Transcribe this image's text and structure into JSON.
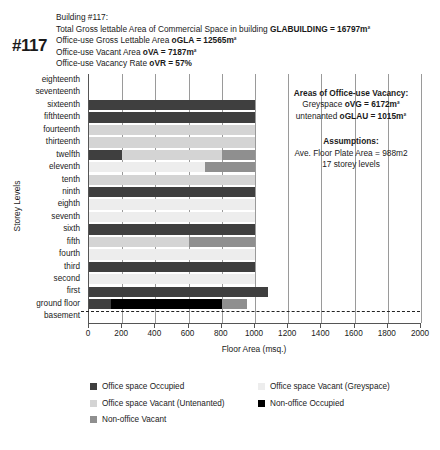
{
  "header": {
    "building_tag": "#117",
    "lines": [
      "Building #117:",
      "Total Gross lettable Area of Commercial Space in building GLABUILDING = 16797m²",
      "Office-use Gross Lettable Area oGLA = 12565m²",
      "Office-use Vacant Area oVA = 7187m²",
      "Office-use Vacancy Rate oVR = 57%"
    ],
    "line1": "Building #117:",
    "line2_pre": "Total Gross lettable Area of Commercial Space in building ",
    "line2_bold": "GLABUILDING = 16797m²",
    "line3_pre": "Office-use Gross Lettable Area ",
    "line3_bold": "oGLA = 12565m²",
    "line4_pre": "Office-use Vacant Area ",
    "line4_bold": "oVA = 7187m²",
    "line5_pre": "Office-use Vacancy Rate ",
    "line5_bold": "oVR = 57%"
  },
  "annotations": {
    "vacancy_title": "Areas of Office-use Vacancy:",
    "vacancy_line1_pre": "Greyspace ",
    "vacancy_line1_bold": "oVG = 6172m²",
    "vacancy_line2_pre": "untenanted ",
    "vacancy_line2_bold": "oGLAU = 1015m²",
    "assumptions_title": "Assumptions:",
    "assumptions_line1": "Ave. Floor Plate Area = 988m2",
    "assumptions_line2": "17 storey levels"
  },
  "colors": {
    "office_occupied": "#3f3f3f",
    "office_vacant_greyspace": "#ededed",
    "office_vacant_untenanted": "#d4d4d4",
    "non_office_occupied": "#000000",
    "non_office_vacant": "#8f8f8f",
    "axis": "#555555",
    "grid": "#9a9a9a"
  },
  "legend": {
    "items": [
      {
        "label": "Office space Occupied",
        "key": "office_occupied",
        "color": "#3f3f3f"
      },
      {
        "label": "Office space Vacant (Greyspace)",
        "key": "office_vacant_greyspace",
        "color": "#ededed"
      },
      {
        "label": "Office space Vacant (Untenanted)",
        "key": "office_vacant_untenanted",
        "color": "#d4d4d4"
      },
      {
        "label": "Non-office Occupied",
        "key": "non_office_occupied",
        "color": "#000000"
      },
      {
        "label": "Non-office Vacant",
        "key": "non_office_vacant",
        "color": "#8f8f8f"
      }
    ]
  },
  "chart_data": {
    "type": "bar",
    "orientation": "horizontal",
    "stacked": true,
    "title": "",
    "xlabel": "Floor Area (msq.)",
    "ylabel": "Storey Levels",
    "xlim": [
      0,
      2000
    ],
    "xticks": [
      0,
      200,
      400,
      600,
      800,
      1000,
      1200,
      1400,
      1600,
      1800,
      2000
    ],
    "grid": true,
    "legend_position": "bottom",
    "categories": [
      "eighteenth",
      "seventeenth",
      "sixteenth",
      "fifthteenth",
      "fourteenth",
      "thirteenth",
      "twelfth",
      "eleventh",
      "tenth",
      "ninth",
      "eighth",
      "seventh",
      "sixth",
      "fifth",
      "fourth",
      "third",
      "second",
      "first",
      "ground floor",
      "basement"
    ],
    "series": [
      {
        "name": "Office space Occupied",
        "key": "office_occupied",
        "values": [
          0,
          0,
          1000,
          1000,
          0,
          0,
          200,
          0,
          0,
          1000,
          0,
          0,
          1000,
          0,
          0,
          1000,
          0,
          1080,
          130,
          0
        ]
      },
      {
        "name": "Office space Vacant (Greyspace)",
        "key": "office_vacant_greyspace",
        "values": [
          0,
          0,
          0,
          0,
          0,
          0,
          0,
          700,
          0,
          0,
          1000,
          1000,
          0,
          0,
          1000,
          0,
          1000,
          0,
          0,
          0
        ]
      },
      {
        "name": "Office space Vacant (Untenanted)",
        "key": "office_vacant_untenanted",
        "values": [
          0,
          0,
          0,
          0,
          1000,
          1000,
          600,
          0,
          1000,
          0,
          0,
          0,
          0,
          600,
          0,
          0,
          0,
          0,
          0,
          0
        ]
      },
      {
        "name": "Non-office Occupied",
        "key": "non_office_occupied",
        "values": [
          0,
          0,
          0,
          0,
          0,
          0,
          0,
          0,
          0,
          0,
          0,
          0,
          0,
          0,
          0,
          0,
          0,
          0,
          670,
          0
        ]
      },
      {
        "name": "Non-office Vacant",
        "key": "non_office_vacant",
        "values": [
          0,
          0,
          0,
          0,
          0,
          0,
          200,
          300,
          0,
          0,
          0,
          0,
          0,
          400,
          0,
          0,
          0,
          0,
          150,
          0
        ]
      }
    ],
    "row_totals": [
      0,
      0,
      1000,
      1000,
      1000,
      1000,
      1000,
      1000,
      1000,
      1000,
      1000,
      1000,
      1000,
      1000,
      1000,
      1000,
      1000,
      1080,
      950,
      0
    ]
  }
}
